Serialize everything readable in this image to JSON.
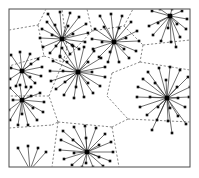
{
  "figure": {
    "width": 199,
    "height": 178,
    "background_color": "#ffffff"
  },
  "frame": {
    "name": "plot-frame",
    "x": 9,
    "y": 9,
    "width": 181,
    "height": 158,
    "stroke_color": "#4a4a4a",
    "stroke_width": 1,
    "fill_color": "#ffffff"
  },
  "style": {
    "hub_color": "#000000",
    "leaf_color": "#0d0d0d",
    "spoke_color": "#222222",
    "voronoi_color": "#555555",
    "hub_size": 4.6,
    "leaf_size": 2.6,
    "spoke_width": 0.65,
    "voronoi_width": 0.7,
    "voronoi_dash": "2.2 1.8"
  },
  "chart_data": {
    "type": "scatter",
    "xlabel": "",
    "ylabel": "",
    "xlim": [
      9,
      190
    ],
    "ylim": [
      9,
      167
    ],
    "grid": false,
    "legend": "none",
    "hub_count": 9,
    "leaf_count": 139,
    "hubs": [
      {
        "id": "h1",
        "label": "top-left-hub",
        "x": 62,
        "y": 39,
        "degree": 21
      },
      {
        "id": "h2",
        "label": "top-center-hub",
        "x": 114,
        "y": 42,
        "degree": 20
      },
      {
        "id": "h3",
        "label": "top-right-hub",
        "x": 170,
        "y": 16,
        "degree": 15
      },
      {
        "id": "h4",
        "label": "left-upper-hub",
        "x": 22,
        "y": 71,
        "degree": 13
      },
      {
        "id": "h5",
        "label": "center-hub",
        "x": 78,
        "y": 72,
        "degree": 24
      },
      {
        "id": "h6",
        "label": "left-lower-hub",
        "x": 22,
        "y": 100,
        "degree": 15
      },
      {
        "id": "h7",
        "label": "right-hub",
        "x": 167,
        "y": 98,
        "degree": 26
      },
      {
        "id": "h8",
        "label": "bottom-center-hub",
        "x": 87,
        "y": 152,
        "degree": 21
      },
      {
        "id": "h9",
        "label": "bottom-left-stub-hub",
        "x": 30,
        "y": 170,
        "degree": 4
      }
    ],
    "leaves": [
      {
        "hub": "h1",
        "x": 48,
        "y": 14
      },
      {
        "hub": "h1",
        "x": 60,
        "y": 12
      },
      {
        "hub": "h1",
        "x": 70,
        "y": 13
      },
      {
        "hub": "h1",
        "x": 79,
        "y": 17
      },
      {
        "hub": "h1",
        "x": 86,
        "y": 24
      },
      {
        "hub": "h1",
        "x": 88,
        "y": 33
      },
      {
        "hub": "h1",
        "x": 85,
        "y": 42
      },
      {
        "hub": "h1",
        "x": 79,
        "y": 49
      },
      {
        "hub": "h1",
        "x": 70,
        "y": 54
      },
      {
        "hub": "h1",
        "x": 60,
        "y": 56
      },
      {
        "hub": "h1",
        "x": 50,
        "y": 53
      },
      {
        "hub": "h1",
        "x": 43,
        "y": 47
      },
      {
        "hub": "h1",
        "x": 40,
        "y": 38
      },
      {
        "hub": "h1",
        "x": 42,
        "y": 29
      },
      {
        "hub": "h1",
        "x": 47,
        "y": 22
      },
      {
        "hub": "h1",
        "x": 55,
        "y": 25
      },
      {
        "hub": "h1",
        "x": 68,
        "y": 26
      },
      {
        "hub": "h1",
        "x": 73,
        "y": 34
      },
      {
        "hub": "h1",
        "x": 72,
        "y": 45
      },
      {
        "hub": "h1",
        "x": 56,
        "y": 46
      },
      {
        "hub": "h1",
        "x": 52,
        "y": 35
      },
      {
        "hub": "h2",
        "x": 100,
        "y": 16
      },
      {
        "hub": "h2",
        "x": 111,
        "y": 14
      },
      {
        "hub": "h2",
        "x": 122,
        "y": 16
      },
      {
        "hub": "h2",
        "x": 131,
        "y": 22
      },
      {
        "hub": "h2",
        "x": 137,
        "y": 31
      },
      {
        "hub": "h2",
        "x": 139,
        "y": 41
      },
      {
        "hub": "h2",
        "x": 136,
        "y": 51
      },
      {
        "hub": "h2",
        "x": 129,
        "y": 58
      },
      {
        "hub": "h2",
        "x": 119,
        "y": 62
      },
      {
        "hub": "h2",
        "x": 108,
        "y": 62
      },
      {
        "hub": "h2",
        "x": 99,
        "y": 57
      },
      {
        "hub": "h2",
        "x": 93,
        "y": 49
      },
      {
        "hub": "h2",
        "x": 92,
        "y": 39
      },
      {
        "hub": "h2",
        "x": 95,
        "y": 29
      },
      {
        "hub": "h2",
        "x": 104,
        "y": 27
      },
      {
        "hub": "h2",
        "x": 119,
        "y": 28
      },
      {
        "hub": "h2",
        "x": 126,
        "y": 38
      },
      {
        "hub": "h2",
        "x": 124,
        "y": 49
      },
      {
        "hub": "h2",
        "x": 110,
        "y": 52
      },
      {
        "hub": "h2",
        "x": 102,
        "y": 42
      },
      {
        "hub": "h3",
        "x": 152,
        "y": 11
      },
      {
        "hub": "h3",
        "x": 160,
        "y": 9
      },
      {
        "hub": "h3",
        "x": 172,
        "y": 9
      },
      {
        "hub": "h3",
        "x": 182,
        "y": 11
      },
      {
        "hub": "h3",
        "x": 187,
        "y": 19
      },
      {
        "hub": "h3",
        "x": 186,
        "y": 29
      },
      {
        "hub": "h3",
        "x": 180,
        "y": 37
      },
      {
        "hub": "h3",
        "x": 171,
        "y": 42
      },
      {
        "hub": "h3",
        "x": 161,
        "y": 41
      },
      {
        "hub": "h3",
        "x": 153,
        "y": 35
      },
      {
        "hub": "h3",
        "x": 149,
        "y": 26
      },
      {
        "hub": "h3",
        "x": 158,
        "y": 23
      },
      {
        "hub": "h3",
        "x": 168,
        "y": 28
      },
      {
        "hub": "h3",
        "x": 177,
        "y": 24
      },
      {
        "hub": "h3",
        "x": 176,
        "y": 47
      },
      {
        "hub": "h4",
        "x": 11,
        "y": 55
      },
      {
        "hub": "h4",
        "x": 20,
        "y": 52
      },
      {
        "hub": "h4",
        "x": 30,
        "y": 54
      },
      {
        "hub": "h4",
        "x": 38,
        "y": 59
      },
      {
        "hub": "h4",
        "x": 42,
        "y": 67
      },
      {
        "hub": "h4",
        "x": 41,
        "y": 76
      },
      {
        "hub": "h4",
        "x": 35,
        "y": 83
      },
      {
        "hub": "h4",
        "x": 26,
        "y": 87
      },
      {
        "hub": "h4",
        "x": 16,
        "y": 86
      },
      {
        "hub": "h4",
        "x": 10,
        "y": 79
      },
      {
        "hub": "h4",
        "x": 11,
        "y": 68
      },
      {
        "hub": "h4",
        "x": 31,
        "y": 64
      },
      {
        "hub": "h4",
        "x": 30,
        "y": 77
      },
      {
        "hub": "h5",
        "x": 62,
        "y": 48
      },
      {
        "hub": "h5",
        "x": 73,
        "y": 46
      },
      {
        "hub": "h5",
        "x": 84,
        "y": 47
      },
      {
        "hub": "h5",
        "x": 94,
        "y": 51
      },
      {
        "hub": "h5",
        "x": 101,
        "y": 58
      },
      {
        "hub": "h5",
        "x": 105,
        "y": 67
      },
      {
        "hub": "h5",
        "x": 105,
        "y": 77
      },
      {
        "hub": "h5",
        "x": 100,
        "y": 86
      },
      {
        "hub": "h5",
        "x": 93,
        "y": 93
      },
      {
        "hub": "h5",
        "x": 84,
        "y": 97
      },
      {
        "hub": "h5",
        "x": 74,
        "y": 98
      },
      {
        "hub": "h5",
        "x": 64,
        "y": 95
      },
      {
        "hub": "h5",
        "x": 56,
        "y": 89
      },
      {
        "hub": "h5",
        "x": 51,
        "y": 81
      },
      {
        "hub": "h5",
        "x": 50,
        "y": 71
      },
      {
        "hub": "h5",
        "x": 53,
        "y": 61
      },
      {
        "hub": "h5",
        "x": 60,
        "y": 57
      },
      {
        "hub": "h5",
        "x": 67,
        "y": 62
      },
      {
        "hub": "h5",
        "x": 88,
        "y": 62
      },
      {
        "hub": "h5",
        "x": 92,
        "y": 72
      },
      {
        "hub": "h5",
        "x": 88,
        "y": 83
      },
      {
        "hub": "h5",
        "x": 76,
        "y": 87
      },
      {
        "hub": "h5",
        "x": 65,
        "y": 82
      },
      {
        "hub": "h5",
        "x": 63,
        "y": 71
      },
      {
        "hub": "h6",
        "x": 10,
        "y": 88
      },
      {
        "hub": "h6",
        "x": 20,
        "y": 85
      },
      {
        "hub": "h6",
        "x": 31,
        "y": 87
      },
      {
        "hub": "h6",
        "x": 40,
        "y": 93
      },
      {
        "hub": "h6",
        "x": 44,
        "y": 102
      },
      {
        "hub": "h6",
        "x": 43,
        "y": 112
      },
      {
        "hub": "h6",
        "x": 37,
        "y": 120
      },
      {
        "hub": "h6",
        "x": 28,
        "y": 125
      },
      {
        "hub": "h6",
        "x": 18,
        "y": 125
      },
      {
        "hub": "h6",
        "x": 10,
        "y": 120
      },
      {
        "hub": "h6",
        "x": 9,
        "y": 110
      },
      {
        "hub": "h6",
        "x": 31,
        "y": 96
      },
      {
        "hub": "h6",
        "x": 33,
        "y": 108
      },
      {
        "hub": "h6",
        "x": 22,
        "y": 114
      },
      {
        "hub": "h6",
        "x": 13,
        "y": 100
      },
      {
        "hub": "h7",
        "x": 148,
        "y": 72
      },
      {
        "hub": "h7",
        "x": 159,
        "y": 68
      },
      {
        "hub": "h7",
        "x": 170,
        "y": 67
      },
      {
        "hub": "h7",
        "x": 180,
        "y": 70
      },
      {
        "hub": "h7",
        "x": 188,
        "y": 77
      },
      {
        "hub": "h7",
        "x": 190,
        "y": 87
      },
      {
        "hub": "h7",
        "x": 189,
        "y": 97
      },
      {
        "hub": "h7",
        "x": 185,
        "y": 107
      },
      {
        "hub": "h7",
        "x": 178,
        "y": 116
      },
      {
        "hub": "h7",
        "x": 168,
        "y": 121
      },
      {
        "hub": "h7",
        "x": 157,
        "y": 120
      },
      {
        "hub": "h7",
        "x": 147,
        "y": 115
      },
      {
        "hub": "h7",
        "x": 140,
        "y": 107
      },
      {
        "hub": "h7",
        "x": 137,
        "y": 97
      },
      {
        "hub": "h7",
        "x": 138,
        "y": 87
      },
      {
        "hub": "h7",
        "x": 143,
        "y": 79
      },
      {
        "hub": "h7",
        "x": 155,
        "y": 83
      },
      {
        "hub": "h7",
        "x": 166,
        "y": 80
      },
      {
        "hub": "h7",
        "x": 177,
        "y": 87
      },
      {
        "hub": "h7",
        "x": 178,
        "y": 98
      },
      {
        "hub": "h7",
        "x": 170,
        "y": 108
      },
      {
        "hub": "h7",
        "x": 158,
        "y": 107
      },
      {
        "hub": "h7",
        "x": 150,
        "y": 97
      },
      {
        "hub": "h7",
        "x": 152,
        "y": 130
      },
      {
        "hub": "h7",
        "x": 172,
        "y": 133
      },
      {
        "hub": "h7",
        "x": 186,
        "y": 124
      },
      {
        "hub": "h8",
        "x": 63,
        "y": 131
      },
      {
        "hub": "h8",
        "x": 74,
        "y": 127
      },
      {
        "hub": "h8",
        "x": 85,
        "y": 126
      },
      {
        "hub": "h8",
        "x": 96,
        "y": 128
      },
      {
        "hub": "h8",
        "x": 105,
        "y": 134
      },
      {
        "hub": "h8",
        "x": 111,
        "y": 142
      },
      {
        "hub": "h8",
        "x": 113,
        "y": 152
      },
      {
        "hub": "h8",
        "x": 110,
        "y": 161
      },
      {
        "hub": "h8",
        "x": 103,
        "y": 166
      },
      {
        "hub": "h8",
        "x": 93,
        "y": 167
      },
      {
        "hub": "h8",
        "x": 82,
        "y": 167
      },
      {
        "hub": "h8",
        "x": 72,
        "y": 165
      },
      {
        "hub": "h8",
        "x": 64,
        "y": 159
      },
      {
        "hub": "h8",
        "x": 60,
        "y": 150
      },
      {
        "hub": "h8",
        "x": 61,
        "y": 140
      },
      {
        "hub": "h8",
        "x": 73,
        "y": 140
      },
      {
        "hub": "h8",
        "x": 86,
        "y": 138
      },
      {
        "hub": "h8",
        "x": 99,
        "y": 145
      },
      {
        "hub": "h8",
        "x": 99,
        "y": 157
      },
      {
        "hub": "h8",
        "x": 86,
        "y": 163
      },
      {
        "hub": "h8",
        "x": 74,
        "y": 153
      },
      {
        "hub": "h9",
        "x": 18,
        "y": 148
      },
      {
        "hub": "h9",
        "x": 28,
        "y": 146
      },
      {
        "hub": "h9",
        "x": 38,
        "y": 148
      },
      {
        "hub": "h9",
        "x": 46,
        "y": 152
      }
    ],
    "voronoi_edges": [
      [
        [
          9,
          30
        ],
        [
          38,
          25
        ]
      ],
      [
        [
          38,
          25
        ],
        [
          46,
          9
        ]
      ],
      [
        [
          38,
          25
        ],
        [
          44,
          56
        ]
      ],
      [
        [
          44,
          56
        ],
        [
          9,
          66
        ]
      ],
      [
        [
          44,
          56
        ],
        [
          63,
          62
        ]
      ],
      [
        [
          63,
          62
        ],
        [
          92,
          31
        ]
      ],
      [
        [
          92,
          31
        ],
        [
          87,
          9
        ]
      ],
      [
        [
          92,
          31
        ],
        [
          124,
          26
        ]
      ],
      [
        [
          124,
          26
        ],
        [
          133,
          9
        ]
      ],
      [
        [
          124,
          26
        ],
        [
          143,
          45
        ]
      ],
      [
        [
          143,
          45
        ],
        [
          190,
          40
        ]
      ],
      [
        [
          143,
          45
        ],
        [
          140,
          62
        ]
      ],
      [
        [
          140,
          62
        ],
        [
          190,
          70
        ]
      ],
      [
        [
          140,
          62
        ],
        [
          112,
          73
        ]
      ],
      [
        [
          112,
          73
        ],
        [
          107,
          96
        ]
      ],
      [
        [
          107,
          96
        ],
        [
          128,
          119
        ]
      ],
      [
        [
          128,
          119
        ],
        [
          190,
          122
        ]
      ],
      [
        [
          128,
          119
        ],
        [
          112,
          127
        ]
      ],
      [
        [
          112,
          127
        ],
        [
          119,
          167
        ]
      ],
      [
        [
          112,
          127
        ],
        [
          58,
          122
        ]
      ],
      [
        [
          58,
          122
        ],
        [
          49,
          96
        ]
      ],
      [
        [
          49,
          96
        ],
        [
          9,
          96
        ]
      ],
      [
        [
          49,
          96
        ],
        [
          63,
          62
        ]
      ],
      [
        [
          58,
          122
        ],
        [
          52,
          167
        ]
      ],
      [
        [
          9,
          128
        ],
        [
          52,
          125
        ]
      ],
      [
        [
          52,
          125
        ],
        [
          58,
          122
        ]
      ],
      [
        [
          63,
          62
        ],
        [
          67,
          48
        ]
      ],
      [
        [
          67,
          48
        ],
        [
          62,
          9
        ]
      ]
    ]
  }
}
